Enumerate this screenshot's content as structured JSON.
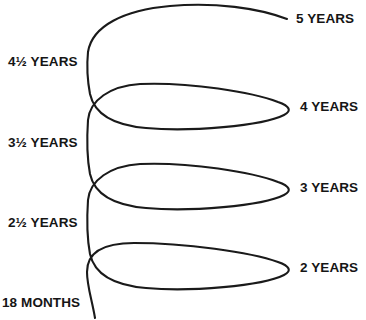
{
  "figure": {
    "type": "spiral-diagram",
    "title": "",
    "stroke_color": "#1a1a1a",
    "background_color": "#ffffff",
    "text_color": "#151515"
  },
  "labels": {
    "right": [
      {
        "id": "five-years",
        "text": "5 YEARS",
        "x": 296,
        "y": 12
      },
      {
        "id": "four-years",
        "text": "4 YEARS",
        "x": 300,
        "y": 100
      },
      {
        "id": "three-years",
        "text": "3 YEARS",
        "x": 300,
        "y": 181
      },
      {
        "id": "two-years",
        "text": "2 YEARS",
        "x": 300,
        "y": 261
      }
    ],
    "left": [
      {
        "id": "four-and-half-years",
        "text": "4½ YEARS",
        "x": 8,
        "y": 55
      },
      {
        "id": "three-and-half-years",
        "text": "3½ YEARS",
        "x": 8,
        "y": 136
      },
      {
        "id": "two-and-half-years",
        "text": "2½ YEARS",
        "x": 8,
        "y": 216
      },
      {
        "id": "eighteen-months",
        "text": "18 MONTHS",
        "x": 2,
        "y": 296
      }
    ]
  },
  "curve": {
    "description": "Continuous helical spiral rising from lower-left to upper-right through four loops",
    "path": "M 95 318 C 92 300, 87 286, 87 272 C 87 252, 104 243, 134 243 C 185 243, 250 252, 278 262 C 290 266, 292 271, 284 275 C 262 286, 190 292, 146 288 C 110 285, 94 272, 90 254 C 87 238, 87 215, 88 200 C 90 180, 110 166, 140 164 C 190 162, 252 172, 278 182 C 290 186, 292 191, 284 195 C 262 206, 190 212, 146 208 C 110 205, 94 192, 90 174 C 87 158, 87 135, 88 120 C 90 100, 110 86, 140 84 C 190 82, 252 92, 278 102 C 290 106, 292 111, 284 115 C 262 126, 190 132, 146 128 C 110 125, 94 112, 90 94 C 87 78, 87 62, 88 52 C 92 26, 124 10, 170 6 C 215 2, 258 8, 287 19"
  }
}
